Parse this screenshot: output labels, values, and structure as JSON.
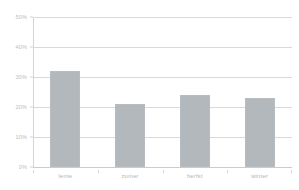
{
  "chart_data": {
    "type": "bar",
    "title": "",
    "subtitle": "",
    "xlabel": "",
    "ylabel": "",
    "categories": [
      "lente",
      "zomer",
      "herfst",
      "winter"
    ],
    "values": [
      32,
      21,
      24,
      23
    ],
    "ylim": [
      0,
      50
    ],
    "y_ticks": [
      0,
      10,
      20,
      30,
      40,
      50
    ],
    "y_tick_labels": [
      "0%",
      "10%",
      "20%",
      "30%",
      "40%",
      "50%"
    ],
    "grid": true,
    "legend": false,
    "legend_position": "none",
    "bar_color": "#b3b8bd",
    "gridline_color": "#d7d9db",
    "axis_text_color": "#b4b8bc",
    "background_color": "#ffffff",
    "value_format": "percent"
  }
}
